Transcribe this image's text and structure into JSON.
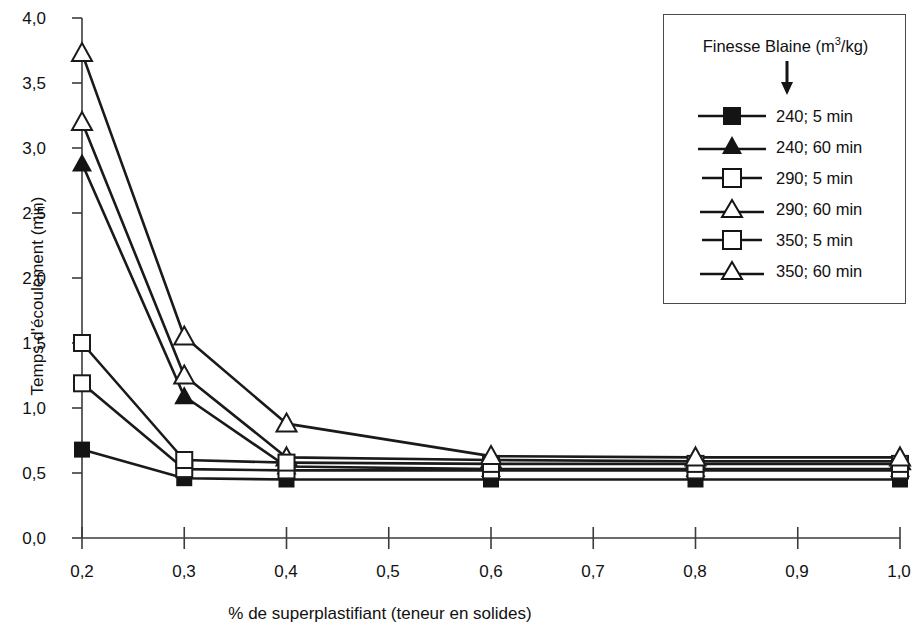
{
  "chart_data": {
    "type": "line",
    "title": "",
    "xlabel": "% de superplastifiant (teneur en solides)",
    "ylabel": "Temps d'écoulement (min)",
    "xlim": [
      0.2,
      1.0
    ],
    "ylim": [
      0.0,
      4.0
    ],
    "xticks": [
      "0,2",
      "0,3",
      "0,4",
      "0,5",
      "0,6",
      "0,7",
      "0,8",
      "0,9",
      "1,0"
    ],
    "xtick_values": [
      0.2,
      0.3,
      0.4,
      0.5,
      0.6,
      0.7,
      0.8,
      0.9,
      1.0
    ],
    "yticks": [
      "0,0",
      "0,5",
      "1,0",
      "1,5",
      "2,0",
      "2,5",
      "3,0",
      "3,5",
      "4,0"
    ],
    "ytick_values": [
      0.0,
      0.5,
      1.0,
      1.5,
      2.0,
      2.5,
      3.0,
      3.5,
      4.0
    ],
    "grid": false,
    "legend_position": "top-right",
    "legend_title": "Finesse Blaine (m3/kg)",
    "x": [
      0.2,
      0.3,
      0.4,
      0.6,
      0.8,
      0.9,
      1.0
    ],
    "series": [
      {
        "name": "240; 5 min",
        "marker": "filled-square",
        "values": [
          0.68,
          0.46,
          0.45,
          0.45,
          0.45,
          0.45,
          0.45
        ]
      },
      {
        "name": "240; 60 min",
        "marker": "filled-triangle",
        "values": [
          2.88,
          1.09,
          0.55,
          0.53,
          0.53,
          0.53,
          0.53
        ]
      },
      {
        "name": "290; 5 min",
        "marker": "open-square",
        "values": [
          1.19,
          0.53,
          0.52,
          0.52,
          0.52,
          0.52,
          0.52
        ]
      },
      {
        "name": "290; 60 min",
        "marker": "open-triangle",
        "values": [
          3.2,
          1.25,
          0.62,
          0.6,
          0.59,
          0.59,
          0.59
        ]
      },
      {
        "name": "350; 5 min",
        "marker": "open-square",
        "values": [
          1.5,
          0.6,
          0.58,
          0.57,
          0.57,
          0.57,
          0.57
        ]
      },
      {
        "name": "350; 60 min",
        "marker": "open-triangle",
        "values": [
          3.73,
          1.55,
          0.88,
          0.63,
          0.62,
          0.62,
          0.62
        ]
      }
    ]
  },
  "axes": {
    "y_title": "Temps d'écoulement (min)",
    "x_title": "% de superplastifiant (teneur en solides)",
    "ylabels": [
      "4,0",
      "3,5",
      "3,0",
      "2,5",
      "2,0",
      "1,5",
      "1,0",
      "0,5",
      "0,0"
    ],
    "xlabels": [
      "0,2",
      "0,3",
      "0,4",
      "0,5",
      "0,6",
      "0,7",
      "0,8",
      "0,9",
      "1,0"
    ]
  },
  "legend": {
    "title_main": "Finesse Blaine (m",
    "title_sup": "3",
    "title_tail": "/kg)",
    "entries": [
      {
        "label": "240; 5 min",
        "marker": "filled-square"
      },
      {
        "label": "240; 60 min",
        "marker": "filled-triangle"
      },
      {
        "label": "290; 5 min",
        "marker": "open-square"
      },
      {
        "label": "290; 60 min",
        "marker": "open-triangle"
      },
      {
        "label": "350; 5 min",
        "marker": "open-square"
      },
      {
        "label": "350; 60 min",
        "marker": "open-triangle"
      }
    ]
  },
  "colors": {
    "line": "#1a1a1a",
    "marker_fill_open": "#ffffff",
    "marker_fill_solid": "#141414",
    "axis": "#3c3c3c",
    "text": "#111111",
    "background": "#ffffff"
  }
}
